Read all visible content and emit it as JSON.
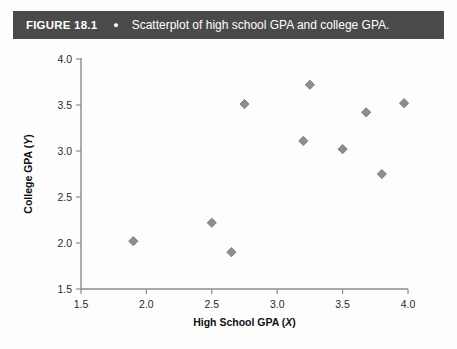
{
  "figure": {
    "label": "FIGURE 18.1",
    "bullet": "●",
    "caption": "Scatterplot of high school GPA and college GPA."
  },
  "colors": {
    "header_bg": "#4a4a4a",
    "header_text": "#ffffff",
    "marker_fill": "#8e8e8e",
    "marker_stroke": "#6f6f6f",
    "axis": "#8c8c8c",
    "page_bg": "#fdfdfd"
  },
  "chart_data": {
    "type": "scatter",
    "title": "Scatterplot of high school GPA and college GPA.",
    "xlabel": "High School GPA (X)",
    "ylabel": "College GPA (Y)",
    "xlabel_main": "High School GPA",
    "xlabel_var": "X",
    "ylabel_main": "College GPA",
    "ylabel_var": "Y",
    "xlim": [
      1.5,
      4.0
    ],
    "ylim": [
      1.5,
      4.0
    ],
    "xticks": [
      1.5,
      2.0,
      2.5,
      3.0,
      3.5,
      4.0
    ],
    "yticks": [
      1.5,
      2.0,
      2.5,
      3.0,
      3.5,
      4.0
    ],
    "xticklabels": [
      "1.5",
      "2.0",
      "2.5",
      "3.0",
      "3.5",
      "4.0"
    ],
    "yticklabels": [
      "1.5",
      "2.0",
      "2.5",
      "3.0",
      "3.5",
      "4.0"
    ],
    "grid": false,
    "legend": false,
    "marker": "diamond",
    "n_points": 10,
    "x": [
      1.9,
      2.5,
      2.65,
      2.75,
      3.2,
      3.25,
      3.5,
      3.68,
      3.8,
      3.97
    ],
    "y": [
      2.02,
      2.22,
      1.9,
      3.51,
      3.11,
      3.72,
      3.02,
      3.42,
      2.75,
      3.52
    ],
    "points": [
      {
        "x": 1.9,
        "y": 2.02
      },
      {
        "x": 2.5,
        "y": 2.22
      },
      {
        "x": 2.65,
        "y": 1.9
      },
      {
        "x": 2.75,
        "y": 3.51
      },
      {
        "x": 3.2,
        "y": 3.11
      },
      {
        "x": 3.25,
        "y": 3.72
      },
      {
        "x": 3.5,
        "y": 3.02
      },
      {
        "x": 3.68,
        "y": 3.42
      },
      {
        "x": 3.8,
        "y": 2.75
      },
      {
        "x": 3.97,
        "y": 3.52
      }
    ]
  }
}
